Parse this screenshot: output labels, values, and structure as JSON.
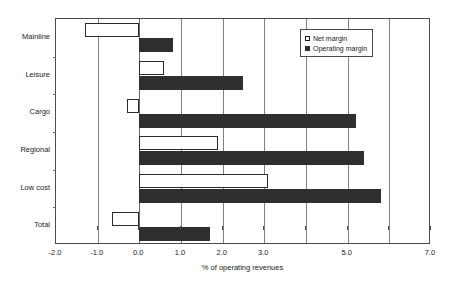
{
  "chart_data": {
    "type": "bar",
    "orientation": "horizontal",
    "title": "",
    "subtitle": "",
    "xlabel": "% of operating revenues",
    "ylabel": "",
    "xlim": [
      -2.0,
      7.0
    ],
    "xticks": [
      -2.0,
      -1.0,
      0.0,
      1.0,
      2.0,
      3.0,
      4.0,
      5.0,
      6.0,
      7.0
    ],
    "xtick_labels": [
      "-2.0",
      "-1.0",
      "0.0",
      "1.0",
      "2.0",
      "3.0",
      "",
      "5.0",
      "",
      "7.0"
    ],
    "grid": "vertical",
    "legend_position": "top-right",
    "categories": [
      "Mainline",
      "Leisure",
      "Cargo",
      "Regional",
      "Low cost",
      "Total"
    ],
    "series": [
      {
        "name": "Net margin",
        "style": "hollow",
        "color": "#ffffff",
        "edge_color": "#2b2b2b",
        "values": [
          -1.3,
          0.6,
          -0.3,
          1.9,
          3.1,
          -0.65
        ]
      },
      {
        "name": "Operating margin",
        "style": "filled",
        "color": "#2f2f2f",
        "edge_color": "#2f2f2f",
        "values": [
          0.8,
          2.5,
          5.2,
          5.4,
          5.8,
          1.7
        ]
      }
    ]
  },
  "legend": {
    "entries": [
      {
        "label": "Net margin",
        "swatch": "net-margin-swatch"
      },
      {
        "label": "Operating margin",
        "swatch": "operating-margin-swatch"
      }
    ]
  },
  "axis": {
    "x_title": "% of operating revenues"
  },
  "colors": {
    "net_margin": "#ffffff",
    "operating_margin": "#2f2f2f",
    "axis": "#4a4a4a",
    "gridline": "#808080",
    "background": "#ffffff",
    "text": "#1a1a1a"
  }
}
